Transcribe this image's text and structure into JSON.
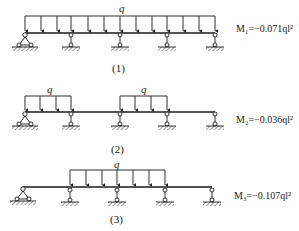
{
  "diagrams": [
    {
      "id": "1",
      "caption": "(1)",
      "load_label": "q",
      "moment_label": "M₁=−0.071ql²",
      "load_spans": [
        [
          25,
          215
        ]
      ],
      "supports_x": [
        25,
        71,
        120,
        167,
        215
      ]
    },
    {
      "id": "2",
      "caption": "(2)",
      "load_labels": [
        "q",
        "q"
      ],
      "moment_label": "M₂=−0.036ql²",
      "load_spans": [
        [
          25,
          71
        ],
        [
          120,
          167
        ]
      ],
      "supports_x": [
        25,
        71,
        120,
        167,
        215
      ]
    },
    {
      "id": "3",
      "caption": "(3)",
      "load_label": "q",
      "moment_label": "M₃=−0.107ql²",
      "load_spans": [
        [
          71,
          167
        ]
      ],
      "supports_x": [
        23,
        70,
        117,
        165,
        212
      ]
    }
  ],
  "colors": {
    "ink": "#1a1a1a",
    "hatch": "#555555",
    "background": "#ffffff"
  }
}
